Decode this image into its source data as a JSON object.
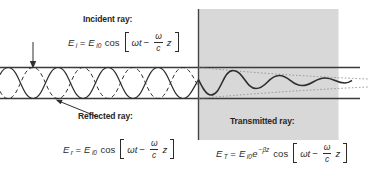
{
  "diagram": {
    "labels": {
      "incident": "Incident ray:",
      "reflected": "Reflected ray:",
      "transmitted": "Transmitted ray:"
    },
    "formulas": {
      "incident": {
        "lhs_base": "E",
        "lhs_sub": "i",
        "eq": "=",
        "amp_base": "E",
        "amp_sub": "i0",
        "func": "cos",
        "arg_pre": "ωt",
        "minus": "−",
        "frac_num": "ω",
        "frac_den": "c",
        "arg_post": "z"
      },
      "reflected": {
        "lhs_base": "E",
        "lhs_sub": "r",
        "eq": "=",
        "amp_base": "E",
        "amp_sub": "i0",
        "func": "cos",
        "arg_pre": "ωt",
        "minus": "−",
        "frac_num": "ω",
        "frac_den": "c",
        "arg_post": "z"
      },
      "transmitted": {
        "lhs_base": "E",
        "lhs_sub": "T",
        "eq": "=",
        "amp_base": "E",
        "amp_sub": "i0",
        "exp_base": "e",
        "exp_sup": "−βz",
        "func": "cos",
        "arg_pre": "ωt",
        "minus": "−",
        "frac_num": "ω",
        "frac_den": "c",
        "arg_post": "z"
      }
    },
    "colors": {
      "medium_fill": "#d8d8d8",
      "boundary_stroke": "#3a3a3a",
      "wave_stroke": "#2e2e2e",
      "envelope_stroke": "#8a8a8a",
      "text": "#2b2b2b"
    }
  }
}
